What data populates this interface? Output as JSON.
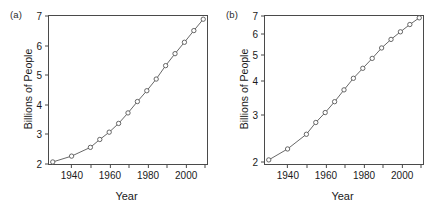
{
  "figure": {
    "panels": [
      {
        "tag": "(a)",
        "xlabel": "Year",
        "ylabel": "Billions of People",
        "yscale": "linear",
        "yticks": [
          2,
          3,
          4,
          5,
          6,
          7
        ],
        "xticks": [
          1940,
          1960,
          1980,
          2000
        ],
        "xminor": [
          1950,
          1970,
          1990,
          2010
        ]
      },
      {
        "tag": "(b)",
        "xlabel": "Year",
        "ylabel": "Billions of People",
        "yscale": "log",
        "yticks": [
          2,
          3,
          4,
          5,
          6,
          7
        ],
        "xticks": [
          1940,
          1960,
          1980,
          2000
        ],
        "xminor": [
          1950,
          1970,
          1990,
          2010
        ]
      }
    ]
  },
  "chart_data": [
    {
      "type": "line",
      "title": "",
      "panel": "(a)",
      "xlabel": "Year",
      "ylabel": "Billions of People",
      "yscale": "linear",
      "xlim": [
        1928,
        2012
      ],
      "ylim": [
        1.93,
        7.0
      ],
      "grid": false,
      "legend": "none",
      "marker": "open-circle",
      "x": [
        1930,
        1940,
        1950,
        1955,
        1960,
        1965,
        1970,
        1975,
        1980,
        1985,
        1990,
        1995,
        2000,
        2005,
        2010
      ],
      "values": [
        2.0,
        2.2,
        2.5,
        2.77,
        3.02,
        3.32,
        3.68,
        4.07,
        4.44,
        4.84,
        5.3,
        5.71,
        6.1,
        6.5,
        6.89
      ]
    },
    {
      "type": "line",
      "title": "",
      "panel": "(b)",
      "xlabel": "Year",
      "ylabel": "Billions of People",
      "yscale": "log",
      "xlim": [
        1928,
        2012
      ],
      "ylim": [
        1.93,
        7.0
      ],
      "grid": false,
      "legend": "none",
      "marker": "open-circle",
      "x": [
        1930,
        1940,
        1950,
        1955,
        1960,
        1965,
        1970,
        1975,
        1980,
        1985,
        1990,
        1995,
        2000,
        2005,
        2010
      ],
      "values": [
        2.0,
        2.2,
        2.5,
        2.77,
        3.02,
        3.32,
        3.68,
        4.07,
        4.44,
        4.84,
        5.3,
        5.71,
        6.1,
        6.5,
        6.89
      ]
    }
  ],
  "style": {
    "line_color": "#555555",
    "marker_edge": "#555555",
    "marker_fill": "#ffffff",
    "axis_color": "#4a4a4a",
    "text_color": "#1a1a1a",
    "background": "#ffffff"
  }
}
